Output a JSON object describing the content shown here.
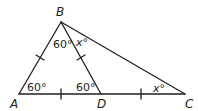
{
  "diagram": {
    "type": "geometry-triangle",
    "line_color": "#231f20",
    "vertices": {
      "A": {
        "label": "A",
        "x": 19,
        "y": 94
      },
      "B": {
        "label": "B",
        "x": 61,
        "y": 22
      },
      "C": {
        "label": "C",
        "x": 185,
        "y": 94
      },
      "D": {
        "label": "D",
        "x": 101,
        "y": 94
      }
    },
    "segments": [
      "AB",
      "BC",
      "AC",
      "BD"
    ],
    "congruence_ticks": [
      "AB",
      "BD",
      "AD",
      "DC"
    ],
    "angle_labels": {
      "angle_A": "60°",
      "angle_ABD": "60°",
      "angle_DBC": "x°",
      "angle_ADB": "60°",
      "angle_C": "x°"
    }
  }
}
